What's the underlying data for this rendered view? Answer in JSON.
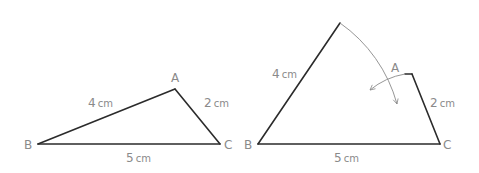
{
  "figure": {
    "left_triangle": {
      "vertices": {
        "A": "A",
        "B": "B",
        "C": "C"
      },
      "sides": {
        "AB": "4",
        "AC": "2",
        "BC": "5"
      },
      "unit": "cm"
    },
    "right_triangle": {
      "vertices": {
        "A": "A",
        "B": "B",
        "C": "C"
      },
      "sides": {
        "AB": "4",
        "AC": "2",
        "BC": "5"
      },
      "unit": "cm",
      "annotation": "Side AB and side AC are rotated toward each other with arcs, showing they cannot meet to form a triangle."
    }
  }
}
